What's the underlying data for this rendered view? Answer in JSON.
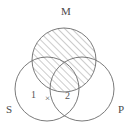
{
  "diagram": {
    "kind": "venn-diagram",
    "title_text": "",
    "stroke_color": "#6b6b6b",
    "hatch_color": "#8a8a8a",
    "background_color": "#ffffff",
    "sets": [
      {
        "id": "M",
        "label": "M",
        "cx": 64,
        "cy": 60,
        "r": 32,
        "shaded": true,
        "shade_style": "diagonal-hatch"
      },
      {
        "id": "S",
        "label": "S",
        "cx": 47,
        "cy": 89,
        "r": 32,
        "shaded": false,
        "shade_style": "none"
      },
      {
        "id": "P",
        "label": "P",
        "cx": 82,
        "cy": 89,
        "r": 32,
        "shaded": false,
        "shade_style": "none"
      }
    ],
    "region_labels": [
      {
        "id": "region-1",
        "text": "1"
      },
      {
        "id": "region-2",
        "text": "2"
      }
    ],
    "marks": [
      {
        "id": "x-mark",
        "text": "×",
        "meaning": "existential-mark"
      }
    ]
  }
}
